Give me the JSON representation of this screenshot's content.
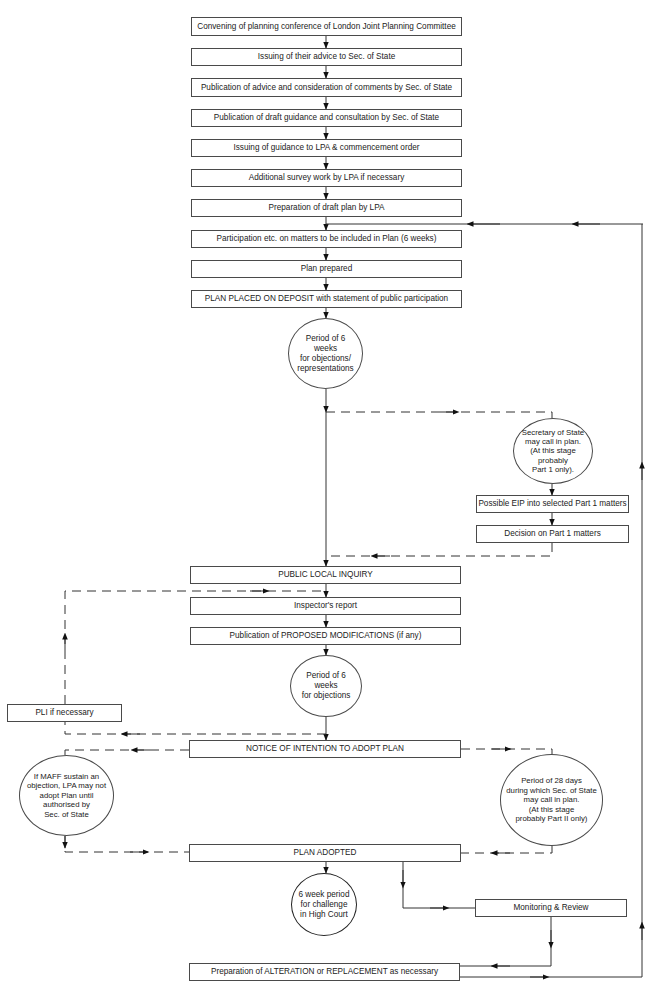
{
  "diagram": {
    "type": "flowchart",
    "boxes": {
      "b1": "Convening of planning conference of London Joint Planning Committee",
      "b2": "Issuing of their advice to Sec. of State",
      "b3": "Publication of advice and consideration of comments by Sec. of State",
      "b4": "Publication of draft guidance and consultation by Sec. of State",
      "b5": "Issuing of guidance to LPA & commencement order",
      "b6": "Additional survey work by LPA if necessary",
      "b7": "Preparation of draft plan by LPA",
      "b8": "Participation etc. on matters to be included in Plan (6 weeks)",
      "b9": "Plan prepared",
      "b10": "PLAN PLACED ON DEPOSIT with statement of public participation",
      "eip": "Possible EIP into selected Part 1 matters",
      "decision": "Decision on Part 1 matters",
      "pli": "PUBLIC LOCAL INQUIRY",
      "report": "Inspector's report",
      "mods": "Publication of PROPOSED MODIFICATIONS (if any)",
      "pli_nec": "PLI if necessary",
      "notice": "NOTICE OF INTENTION TO ADOPT PLAN",
      "adopted": "PLAN ADOPTED",
      "monitor": "Monitoring & Review",
      "alteration": "Preparation of ALTERATION or REPLACEMENT as necessary"
    },
    "circles": {
      "c_objections": "Period of 6 weeks\nfor objections/\nrepresentations",
      "c_sos_callin": "Secretary of State\nmay call in plan.\n(At this stage\nprobably\nPart 1 only).",
      "c_mod_objections": "Period of 6 weeks\nfor objections",
      "c_maff": "If MAFF sustain an\nobjection, LPA may not\nadopt Plan until\nauthorised by\nSec. of State",
      "c_28days": "Period of 28 days\nduring which Sec. of State\nmay call in plan.\n(At this stage\nprobably Part II only)",
      "c_highcourt": "6 week period\nfor challenge\nin High Court"
    },
    "line_legend": {
      "solid": "main sequence",
      "dashed": "conditional / optional path"
    }
  }
}
